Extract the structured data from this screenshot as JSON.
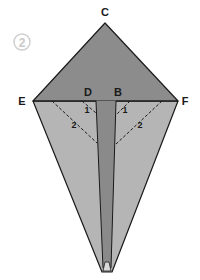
{
  "diagram": {
    "step_number": "2",
    "labels": {
      "top": "C",
      "left": "E",
      "right": "F",
      "inner_left": "D",
      "inner_right": "B"
    },
    "fold_marks": {
      "left_small": "1",
      "left_large": "2",
      "right_small": "1",
      "right_large": "2"
    },
    "colors": {
      "top_flap": "#8c8c8c",
      "side_flaps": "#b5b5b5",
      "center_strip": "#8a8a8a",
      "outline": "#1a1a1a",
      "step_circle": "#cfcfcf"
    }
  }
}
